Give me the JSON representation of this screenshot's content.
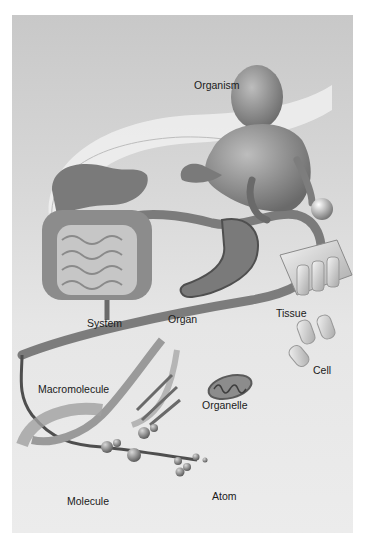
{
  "figure": {
    "levels": [
      {
        "id": "organism",
        "label": "Organism"
      },
      {
        "id": "system",
        "label": "System"
      },
      {
        "id": "organ",
        "label": "Organ"
      },
      {
        "id": "tissue",
        "label": "Tissue"
      },
      {
        "id": "cell",
        "label": "Cell"
      },
      {
        "id": "organelle",
        "label": "Organelle"
      },
      {
        "id": "macromolecule",
        "label": "Macromolecule"
      },
      {
        "id": "molecule",
        "label": "Molecule"
      },
      {
        "id": "atom",
        "label": "Atom"
      }
    ],
    "colors": {
      "background_top": "#c8c8c8",
      "background_bottom": "#ececec",
      "pathway": "#6e6e6e",
      "halo": "#f2f2f2"
    }
  }
}
